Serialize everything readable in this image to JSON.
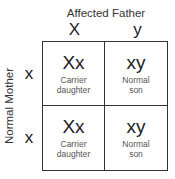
{
  "father": {
    "label": "Affected Father",
    "alleles": [
      "X",
      "y"
    ]
  },
  "mother": {
    "label": "Normal Mother",
    "alleles": [
      "x",
      "x"
    ]
  },
  "cells": [
    {
      "genotype": "Xx",
      "phenotype_line1": "Carrier",
      "phenotype_line2": "daughter"
    },
    {
      "genotype": "xy",
      "phenotype_line1": "Normal",
      "phenotype_line2": "son"
    },
    {
      "genotype": "Xx",
      "phenotype_line1": "Carrier",
      "phenotype_line2": "daughter"
    },
    {
      "genotype": "xy",
      "phenotype_line1": "Normal",
      "phenotype_line2": "son"
    }
  ]
}
